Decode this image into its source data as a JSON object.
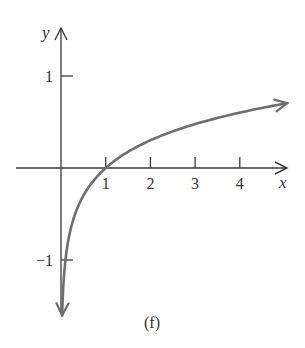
{
  "chart_data": {
    "type": "line",
    "title": "",
    "caption": "(f)",
    "xlabel": "x",
    "ylabel": "y",
    "function": "y = log10(x)",
    "x_ticks": [
      1,
      2,
      3,
      4
    ],
    "x_tick_labels": [
      "1",
      "2",
      "3",
      "4"
    ],
    "y_ticks": [
      1,
      -1
    ],
    "y_tick_labels": [
      "1",
      "−1"
    ],
    "xlim": [
      -1,
      5.1
    ],
    "ylim": [
      -1.65,
      1.55
    ],
    "grid": false,
    "legend": null,
    "series": [
      {
        "name": "curve",
        "x": [
          0.025,
          0.05,
          0.1,
          0.2,
          0.5,
          1,
          1.5,
          2,
          2.5,
          3,
          3.5,
          4,
          4.5,
          5.06
        ],
        "y": [
          -1.6,
          -1.3,
          -1.0,
          -0.7,
          -0.3,
          0,
          0.18,
          0.3,
          0.4,
          0.48,
          0.54,
          0.6,
          0.65,
          0.7
        ],
        "color": "#6e6e6e",
        "arrow_ends": true
      }
    ],
    "axis_color": "#3a3a3a"
  }
}
